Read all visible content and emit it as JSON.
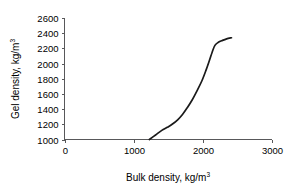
{
  "chart_data": {
    "type": "line",
    "title": "",
    "xlabel": "Bulk density, kg/m3",
    "ylabel": "Gel density, kg/m3",
    "xlabel_base": "Bulk density, kg/m",
    "xlabel_exp": "3",
    "ylabel_base": "Gel density, kg/m",
    "ylabel_exp": "3",
    "xlim": [
      0,
      3000
    ],
    "ylim": [
      1000,
      2600
    ],
    "xticks": [
      0,
      1000,
      2000,
      3000
    ],
    "yticks": [
      1000,
      1200,
      1400,
      1600,
      1800,
      2000,
      2200,
      2400,
      2600
    ],
    "xtick_labels": [
      "0",
      "1000",
      "2000",
      "3000"
    ],
    "ytick_labels": [
      "1000",
      "1200",
      "1400",
      "1600",
      "1800",
      "2000",
      "2200",
      "2400",
      "2600"
    ],
    "grid": false,
    "legend": false,
    "series": [
      {
        "name": "gel density vs bulk density",
        "color": "#1a1a1a",
        "x": [
          1230,
          1320,
          1410,
          1490,
          1560,
          1640,
          1710,
          1780,
          1850,
          1920,
          1990,
          2050,
          2100,
          2140,
          2180,
          2230,
          2290,
          2350,
          2420
        ],
        "y": [
          1000,
          1060,
          1120,
          1160,
          1200,
          1260,
          1330,
          1420,
          1520,
          1640,
          1770,
          1910,
          2040,
          2150,
          2240,
          2280,
          2305,
          2325,
          2340
        ]
      }
    ]
  },
  "axes": {
    "axis_color": "#58585a",
    "curve_color": "#1a1a1a",
    "background": "#ffffff"
  }
}
